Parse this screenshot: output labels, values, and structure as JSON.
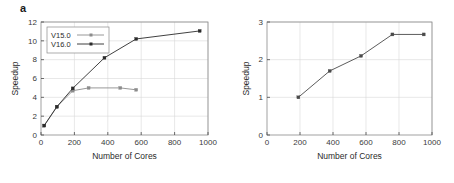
{
  "figure": {
    "panel_a_letter": "a",
    "panel_b_letter": "b"
  },
  "chart_data": [
    {
      "type": "line",
      "panel": "a",
      "title": "",
      "xlabel": "Number of Cores",
      "ylabel": "Speedup",
      "xlim": [
        0,
        1000
      ],
      "ylim": [
        0,
        12
      ],
      "xticks": [
        0,
        200,
        400,
        600,
        800,
        1000
      ],
      "yticks": [
        0,
        2,
        4,
        6,
        8,
        10,
        12
      ],
      "xtick_labels": [
        "0",
        "200",
        "400",
        "600",
        "800",
        "1000"
      ],
      "ytick_labels": [
        "0",
        "2",
        "4",
        "6",
        "8",
        "10",
        "12"
      ],
      "grid": true,
      "legend_position": "upper left",
      "series": [
        {
          "name": "V15.0",
          "color": "#8c8c8c",
          "marker": "square",
          "x": [
            19,
            95,
            190,
            285,
            475,
            570
          ],
          "y": [
            1.0,
            3.0,
            4.7,
            5.0,
            5.0,
            4.8
          ]
        },
        {
          "name": "V16.0",
          "color": "#2b2b2b",
          "marker": "square",
          "x": [
            19,
            95,
            190,
            380,
            570,
            950
          ],
          "y": [
            1.0,
            3.0,
            4.95,
            8.2,
            10.2,
            11.05
          ]
        }
      ]
    },
    {
      "type": "line",
      "panel": "b",
      "title": "",
      "xlabel": "Number of Cores",
      "ylabel": "Speedup",
      "xlim": [
        0,
        1000
      ],
      "ylim": [
        0,
        3
      ],
      "xticks": [
        0,
        200,
        400,
        600,
        800,
        1000
      ],
      "yticks": [
        0,
        1,
        2,
        3
      ],
      "xtick_labels": [
        "0",
        "200",
        "400",
        "600",
        "800",
        "1000"
      ],
      "ytick_labels": [
        "0",
        "1",
        "2",
        "3"
      ],
      "grid": true,
      "legend_position": "none",
      "series": [
        {
          "name": "speedup",
          "color": "#4a4a4a",
          "marker": "square",
          "x": [
            190,
            380,
            570,
            760,
            950
          ],
          "y": [
            1.0,
            1.7,
            2.1,
            2.67,
            2.67
          ]
        }
      ]
    }
  ]
}
